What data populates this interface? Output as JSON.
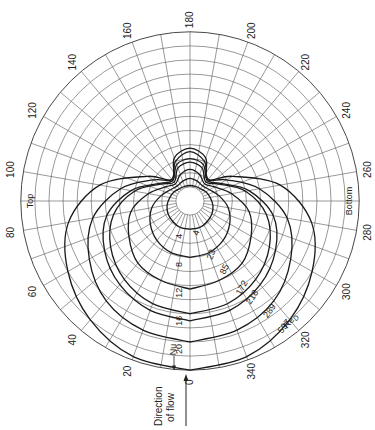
{
  "chart_data": {
    "type": "line",
    "subtype": "polar",
    "title": "",
    "angular_axis": {
      "unit": "degrees",
      "zero_position": "bottom",
      "direction": "clockwise",
      "tick_labels": [
        "0",
        "20",
        "40",
        "60",
        "80",
        "100",
        "120",
        "140",
        "160",
        "180",
        "200",
        "220",
        "240",
        "260",
        "280",
        "300",
        "320",
        "340"
      ],
      "region_labels": [
        {
          "text": "Top",
          "angle": 90
        },
        {
          "text": "Bottom",
          "angle": 270
        }
      ]
    },
    "radial_axis": {
      "label": "Nu",
      "tick_labels": [
        "4",
        "8",
        "12",
        "16",
        "20"
      ],
      "range": [
        0,
        24
      ],
      "grid_step": 2
    },
    "series_label": "Re_D",
    "angles": [
      0,
      20,
      40,
      60,
      80,
      100,
      120,
      140,
      160,
      180
    ],
    "series": [
      {
        "name": "597",
        "values": [
          24,
          23.5,
          22,
          20,
          17.5,
          13,
          7,
          4,
          6.5,
          7.5
        ]
      },
      {
        "name": "289",
        "values": [
          20,
          19.5,
          18.5,
          16.5,
          14,
          10,
          6,
          4,
          6,
          7
        ]
      },
      {
        "name": "218",
        "values": [
          17,
          16.5,
          15.5,
          14,
          12,
          8.5,
          5,
          3.8,
          5.5,
          6
        ]
      },
      {
        "name": "172",
        "values": [
          16,
          15.5,
          14.5,
          13,
          11,
          8,
          4.8,
          3.5,
          5,
          5.5
        ]
      },
      {
        "name": "85",
        "values": [
          12.5,
          12,
          11.5,
          10,
          8.5,
          6,
          4,
          3.2,
          4,
          4.5
        ]
      },
      {
        "name": "23",
        "values": [
          8,
          7.8,
          7.3,
          6.5,
          5.5,
          4.2,
          3.2,
          2.8,
          3,
          3.2
        ]
      },
      {
        "name": "4",
        "values": [
          4,
          4,
          3.8,
          3.6,
          3.3,
          2.9,
          2.6,
          2.3,
          2.2,
          2.2
        ]
      }
    ],
    "symmetry": "curves mirrored about 0-180 axis",
    "annotations": [
      "Nu",
      "Re_D",
      "Direction of flow"
    ],
    "grid": true,
    "legend": "inline labels along 0-340 radial"
  },
  "labels": {
    "nu": "Nu",
    "re": "Re",
    "re_sub": "D",
    "top": "Top",
    "bottom": "Bottom",
    "flow_line1": "Direction",
    "flow_line2": "of flow"
  }
}
